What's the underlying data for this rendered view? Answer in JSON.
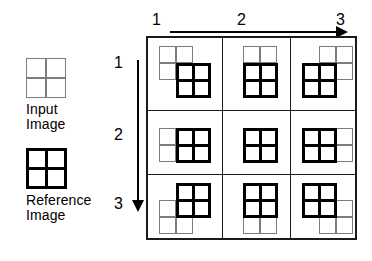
{
  "legend": {
    "input": {
      "icon": "input-image-square-icon",
      "caption_line1": "Input",
      "caption_line2": "Image",
      "color": "#7d7d7d",
      "style": "thin gray 2x2 square"
    },
    "reference": {
      "icon": "reference-image-square-icon",
      "caption_line1": "Reference",
      "caption_line2": "Image",
      "color": "#000000",
      "style": "thick black 2x2 square"
    }
  },
  "axes": {
    "top": {
      "orientation": "horizontal",
      "arrow_direction": "right",
      "ticks": [
        "1",
        "2",
        "3"
      ]
    },
    "left": {
      "orientation": "vertical",
      "arrow_direction": "down",
      "ticks": [
        "1",
        "2",
        "3"
      ]
    }
  },
  "chart_data": {
    "type": "diagram",
    "title": "",
    "columns": [
      "1",
      "2",
      "3"
    ],
    "rows": [
      "1",
      "2",
      "3"
    ],
    "cells": [
      {
        "row": 1,
        "col": 1,
        "input_dx": 0,
        "input_dy": 0,
        "ref_dx": 17,
        "ref_dy": 17
      },
      {
        "row": 1,
        "col": 2,
        "input_dx": 9,
        "input_dy": 0,
        "ref_dx": 9,
        "ref_dy": 17
      },
      {
        "row": 1,
        "col": 3,
        "input_dx": 17,
        "input_dy": 0,
        "ref_dx": 0,
        "ref_dy": 17
      },
      {
        "row": 2,
        "col": 1,
        "input_dx": 0,
        "input_dy": 9,
        "ref_dx": 17,
        "ref_dy": 9
      },
      {
        "row": 2,
        "col": 2,
        "input_dx": 9,
        "input_dy": 9,
        "ref_dx": 9,
        "ref_dy": 9
      },
      {
        "row": 2,
        "col": 3,
        "input_dx": 17,
        "input_dy": 9,
        "ref_dx": 0,
        "ref_dy": 9
      },
      {
        "row": 3,
        "col": 1,
        "input_dx": 0,
        "input_dy": 17,
        "ref_dx": 17,
        "ref_dy": 0
      },
      {
        "row": 3,
        "col": 2,
        "input_dx": 9,
        "input_dy": 17,
        "ref_dx": 9,
        "ref_dy": 0
      },
      {
        "row": 3,
        "col": 3,
        "input_dx": 17,
        "input_dy": 17,
        "ref_dx": 0,
        "ref_dy": 0
      }
    ],
    "colors": {
      "input": "#7d7d7d",
      "reference": "#000000",
      "grid_line": "#1a1a1a"
    }
  }
}
